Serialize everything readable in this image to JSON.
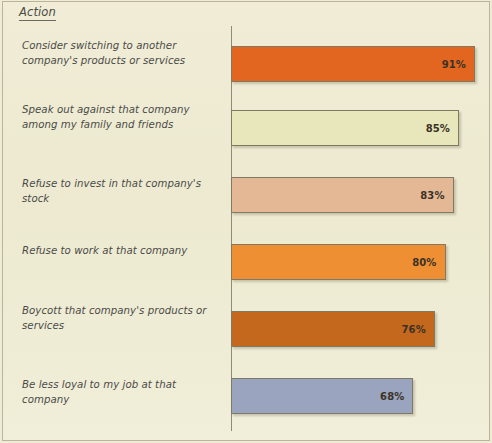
{
  "header": {
    "column_label": "Action"
  },
  "chart_data": {
    "type": "bar",
    "orientation": "horizontal",
    "title": "",
    "subtitle": "",
    "xlabel": "",
    "ylabel": "Action",
    "xlim": [
      0,
      100
    ],
    "grid": false,
    "legend": "none",
    "categories": [
      "Consider switching to another company's products or services",
      "Speak out against that company among my family and friends",
      "Refuse to invest in that company's stock",
      "Refuse to work at that company",
      "Boycott that company's products or services",
      "Be less loyal to my job at that company"
    ],
    "values": [
      91,
      85,
      83,
      80,
      76,
      68
    ],
    "value_labels": [
      "91%",
      "85%",
      "83%",
      "80%",
      "76%",
      "68%"
    ],
    "colors": [
      "#e2661f",
      "#e8e7bb",
      "#e5b895",
      "#ef8f34",
      "#c3681d",
      "#9aa4be"
    ],
    "border_color": "#7e7a63",
    "background_color": "#efebd4",
    "text_color": "#4b4b48"
  },
  "bars": [
    {
      "label": "Consider switching to another company's products or services",
      "value_label": "91%",
      "value": 91,
      "color": "#e2661f"
    },
    {
      "label": "Speak out against that company among my family and friends",
      "value_label": "85%",
      "value": 85,
      "color": "#e8e7bb"
    },
    {
      "label": "Refuse to invest in that company's stock",
      "value_label": "83%",
      "value": 83,
      "color": "#e5b895"
    },
    {
      "label": "Refuse to work at that company",
      "value_label": "80%",
      "value": 80,
      "color": "#ef8f34"
    },
    {
      "label": "Boycott that company's products or services",
      "value_label": "76%",
      "value": 76,
      "color": "#c3681d"
    },
    {
      "label": "Be less loyal to my job at that company",
      "value_label": "68%",
      "value": 68,
      "color": "#9aa4be"
    }
  ]
}
